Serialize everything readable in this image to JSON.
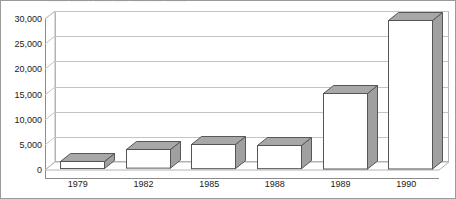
{
  "chart_data": {
    "type": "bar",
    "title": "",
    "xlabel": "",
    "ylabel": "",
    "categories": [
      "1979",
      "1982",
      "1985",
      "1988",
      "1989",
      "1990"
    ],
    "values": [
      1400,
      3700,
      4800,
      4600,
      15000,
      29500
    ],
    "series": [
      {
        "name": "",
        "values": [
          1400,
          3700,
          4800,
          4600,
          15000,
          29500
        ]
      }
    ],
    "ylim": [
      0,
      30000
    ],
    "yticks": [
      0,
      5000,
      10000,
      15000,
      20000,
      25000,
      30000
    ],
    "ytick_labels": [
      "0",
      "5,000",
      "10,000",
      "15,000",
      "20,000",
      "25,000",
      "30,000"
    ],
    "grid": true,
    "legend": false,
    "style": "3d-column",
    "colors": {
      "bar_front": "#ffffff",
      "bar_top": "#a8a8a8",
      "bar_side": "#a0a0a0",
      "bar_outline": "#555555",
      "gridline": "#c4c4c4",
      "axis": "#8c8c8c",
      "border": "#9a9a9a",
      "text": "#1a1a1a",
      "background": "#ffffff"
    }
  },
  "chart": {
    "title_clipped": "........ ........ ....... ,.... ............ ........",
    "frame_label": "3d-column-chart"
  }
}
